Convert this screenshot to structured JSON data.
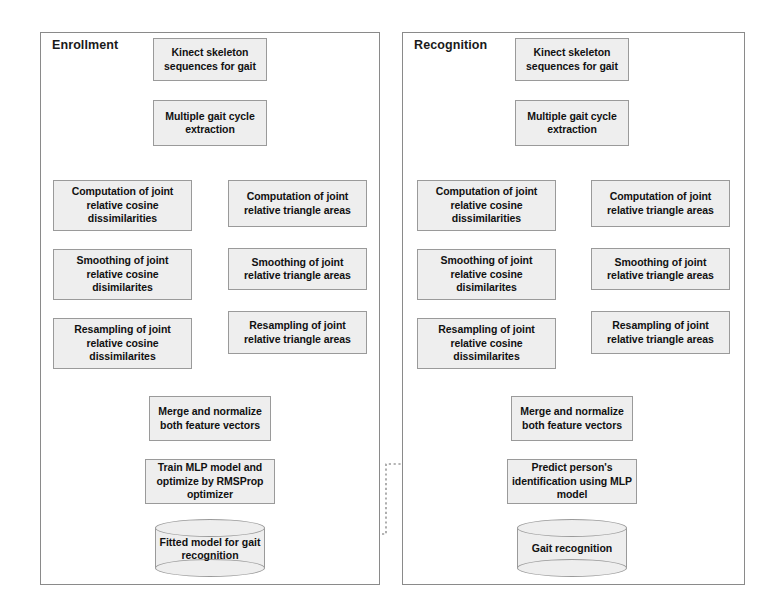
{
  "diagram": {
    "title_left": "Enrollment",
    "title_right": "Recognition"
  },
  "panels": [
    {
      "id": "enrollment",
      "label": "Enrollment",
      "nodes": {
        "input": "Kinect skeleton sequences for gait",
        "cycle": "Multiple gait cycle extraction",
        "left_compute": "Computation of joint relative cosine dissimilarities",
        "left_smooth": "Smoothing of joint relative cosine disimilarites",
        "left_resample": "Resampling of joint relative cosine dissimilarites",
        "right_compute": "Computation of joint relative triangle areas",
        "right_smooth": "Smoothing of joint relative triangle areas",
        "right_resample": "Resampling of joint relative triangle areas",
        "merge": "Merge and normalize both feature vectors",
        "model": "Train MLP model and optimize by RMSProp optimizer",
        "store": "Fitted model for gait recognition"
      }
    },
    {
      "id": "recognition",
      "label": "Recognition",
      "nodes": {
        "input": "Kinect skeleton sequences for gait",
        "cycle": "Multiple gait cycle extraction",
        "left_compute": "Computation of joint relative cosine dissimilarities",
        "left_smooth": "Smoothing of joint relative cosine disimilarites",
        "left_resample": "Resampling of joint relative cosine dissimilarites",
        "right_compute": "Computation of joint relative triangle areas",
        "right_smooth": "Smoothing of joint relative triangle areas",
        "right_resample": "Resampling of joint relative triangle areas",
        "merge": "Merge and normalize both feature vectors",
        "model": "Predict person's identification using MLP model",
        "store": "Gait recognition"
      }
    }
  ],
  "colors": {
    "node_fill": "#eeeeee",
    "node_border": "#9a9a9a",
    "panel_border": "#8a8a8a",
    "wire": "#4a4a4a",
    "dotted_wire": "#7a7a7a",
    "text": "#111111",
    "background": "#ffffff"
  }
}
